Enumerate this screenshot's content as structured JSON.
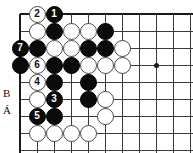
{
  "figure": {
    "kind": "go-board-diagram",
    "board": {
      "origin_x": 20,
      "origin_y": 14,
      "spacing": 17.0,
      "cols": 11,
      "rows": 9,
      "star_points": [
        {
          "col": 8,
          "row": 3
        }
      ],
      "line_color": "#3a3a3a",
      "edge_color": "#1a1a1a",
      "background": "#ffffff"
    },
    "stones": [
      {
        "col": 1,
        "row": 0,
        "color": "white",
        "label": "2"
      },
      {
        "col": 2,
        "row": 0,
        "color": "black",
        "label": "1"
      },
      {
        "col": 1,
        "row": 1,
        "color": "white",
        "label": ""
      },
      {
        "col": 2,
        "row": 1,
        "color": "black",
        "label": ""
      },
      {
        "col": 3,
        "row": 1,
        "color": "white",
        "label": ""
      },
      {
        "col": 4,
        "row": 1,
        "color": "white",
        "label": ""
      },
      {
        "col": 5,
        "row": 1,
        "color": "black",
        "label": ""
      },
      {
        "col": 0,
        "row": 2,
        "color": "black",
        "label": "7"
      },
      {
        "col": 1,
        "row": 2,
        "color": "black",
        "label": ""
      },
      {
        "col": 2,
        "row": 2,
        "color": "white",
        "label": ""
      },
      {
        "col": 3,
        "row": 2,
        "color": "white",
        "label": ""
      },
      {
        "col": 4,
        "row": 2,
        "color": "black",
        "label": ""
      },
      {
        "col": 5,
        "row": 2,
        "color": "black",
        "label": ""
      },
      {
        "col": 6,
        "row": 2,
        "color": "white",
        "label": ""
      },
      {
        "col": 0,
        "row": 3,
        "color": "black",
        "label": ""
      },
      {
        "col": 1,
        "row": 3,
        "color": "white",
        "label": "6"
      },
      {
        "col": 2,
        "row": 3,
        "color": "black",
        "label": ""
      },
      {
        "col": 3,
        "row": 3,
        "color": "black",
        "label": ""
      },
      {
        "col": 4,
        "row": 3,
        "color": "white",
        "label": ""
      },
      {
        "col": 5,
        "row": 3,
        "color": "white",
        "label": ""
      },
      {
        "col": 6,
        "row": 3,
        "color": "white",
        "label": ""
      },
      {
        "col": 1,
        "row": 4,
        "color": "white",
        "label": "4"
      },
      {
        "col": 2,
        "row": 4,
        "color": "black",
        "label": ""
      },
      {
        "col": 4,
        "row": 4,
        "color": "black",
        "label": ""
      },
      {
        "col": 1,
        "row": 5,
        "color": "white",
        "label": ""
      },
      {
        "col": 2,
        "row": 5,
        "color": "black",
        "label": "3"
      },
      {
        "col": 4,
        "row": 5,
        "color": "black",
        "label": ""
      },
      {
        "col": 5,
        "row": 5,
        "color": "white",
        "label": ""
      },
      {
        "col": 1,
        "row": 6,
        "color": "black",
        "label": "5"
      },
      {
        "col": 2,
        "row": 6,
        "color": "black",
        "label": ""
      },
      {
        "col": 5,
        "row": 6,
        "color": "white",
        "label": ""
      },
      {
        "col": 1,
        "row": 7,
        "color": "white",
        "label": ""
      },
      {
        "col": 2,
        "row": 7,
        "color": "white",
        "label": ""
      },
      {
        "col": 3,
        "row": 7,
        "color": "white",
        "label": ""
      },
      {
        "col": 4,
        "row": 7,
        "color": "white",
        "label": ""
      }
    ],
    "coordinate_labels": [
      {
        "text": "B",
        "x": 3,
        "y": 88
      },
      {
        "text": "Á",
        "x": 3,
        "y": 105
      }
    ]
  }
}
